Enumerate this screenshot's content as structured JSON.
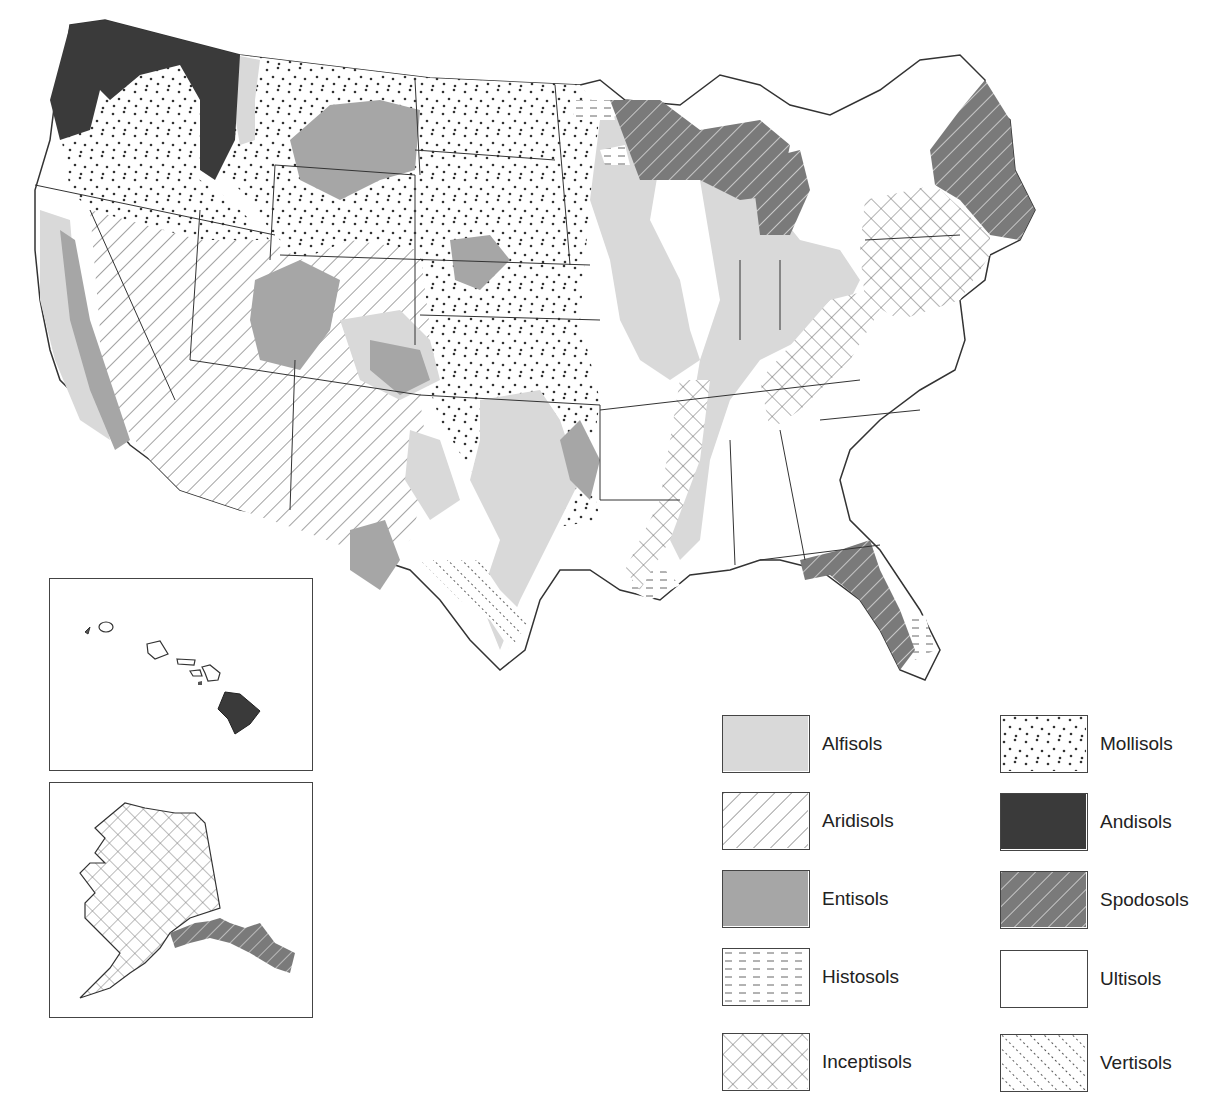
{
  "map": {
    "title": "Soil orders of the United States",
    "region": "Contiguous United States",
    "insets": [
      {
        "name": "Hawaii",
        "dominant_soil": "Andisols"
      },
      {
        "name": "Alaska",
        "dominant_soil": "Inceptisols",
        "secondary_soil": "Spodosols"
      }
    ]
  },
  "legend": {
    "items": [
      {
        "id": "alfisols",
        "label": "Alfisols",
        "pattern": "light-gray-fill",
        "color": "#d9d9d9"
      },
      {
        "id": "aridisols",
        "label": "Aridisols",
        "pattern": "diagonal-lines",
        "color": "#ffffff"
      },
      {
        "id": "entisols",
        "label": "Entisols",
        "pattern": "medium-gray-fill",
        "color": "#a6a6a6"
      },
      {
        "id": "histosols",
        "label": "Histosols",
        "pattern": "dashed-horizontal-lines",
        "color": "#ffffff"
      },
      {
        "id": "inceptisols",
        "label": "Inceptisols",
        "pattern": "crosshatch",
        "color": "#ffffff"
      },
      {
        "id": "mollisols",
        "label": "Mollisols",
        "pattern": "random-dots",
        "color": "#ffffff"
      },
      {
        "id": "andisols",
        "label": "Andisols",
        "pattern": "solid-dark-fill",
        "color": "#3a3a3a"
      },
      {
        "id": "spodosols",
        "label": "Spodosols",
        "pattern": "dark-gray-with-white-diagonals",
        "color": "#7a7a7a"
      },
      {
        "id": "ultisols",
        "label": "Ultisols",
        "pattern": "white-fill",
        "color": "#ffffff"
      },
      {
        "id": "vertisols",
        "label": "Vertisols",
        "pattern": "dotted-diagonal-lines",
        "color": "#ffffff"
      }
    ]
  }
}
